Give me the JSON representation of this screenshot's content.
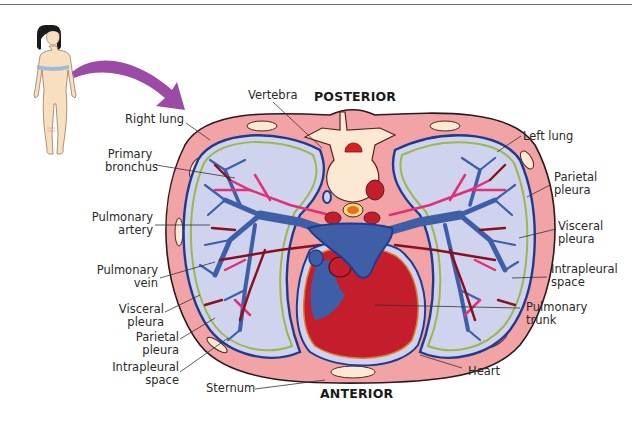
{
  "figure": {
    "orientation": {
      "posterior": "POSTERIOR",
      "anterior": "ANTERIOR"
    },
    "labels_left": [
      {
        "id": "right-lung",
        "lines": [
          "Right lung"
        ]
      },
      {
        "id": "primary-bronchus",
        "lines": [
          "Primary",
          "bronchus"
        ]
      },
      {
        "id": "pulmonary-artery",
        "lines": [
          "Pulmonary",
          "artery"
        ]
      },
      {
        "id": "pulmonary-vein",
        "lines": [
          "Pulmonary",
          "vein"
        ]
      },
      {
        "id": "visceral-pleura-left",
        "lines": [
          "Visceral",
          "pleura"
        ]
      },
      {
        "id": "parietal-pleura-left",
        "lines": [
          "Parietal",
          "pleura"
        ]
      },
      {
        "id": "intrapleural-space-left",
        "lines": [
          "Intrapleural",
          "space"
        ]
      }
    ],
    "labels_top": [
      {
        "id": "vertebra",
        "lines": [
          "Vertebra"
        ]
      }
    ],
    "labels_right": [
      {
        "id": "left-lung",
        "lines": [
          "Left lung"
        ]
      },
      {
        "id": "parietal-pleura-right",
        "lines": [
          "Parietal",
          "pleura"
        ]
      },
      {
        "id": "visceral-pleura-right",
        "lines": [
          "Visceral",
          "pleura"
        ]
      },
      {
        "id": "intrapleural-space-right",
        "lines": [
          "Intrapleural",
          "space"
        ]
      },
      {
        "id": "pulmonary-trunk",
        "lines": [
          "Pulmonary",
          "trunk"
        ]
      }
    ],
    "labels_bottom": [
      {
        "id": "sternum",
        "lines": [
          "Sternum"
        ]
      },
      {
        "id": "heart",
        "lines": [
          "Heart"
        ]
      }
    ],
    "colors": {
      "body_wall": "#f2a3a6",
      "body_wall_outline": "#2b1a1a",
      "pleural_space": "#cfd3ee",
      "pleura_blue": "#1f3a8f",
      "pleura_green": "#9bb84a",
      "bronchus": "#3e5fa8",
      "artery": "#e0307a",
      "vein": "#8a0f1f",
      "heart": "#c41d2c",
      "bone": "#fbe9d4",
      "arrow": "#9b4aa6",
      "skin": "#f8dfbf"
    }
  }
}
